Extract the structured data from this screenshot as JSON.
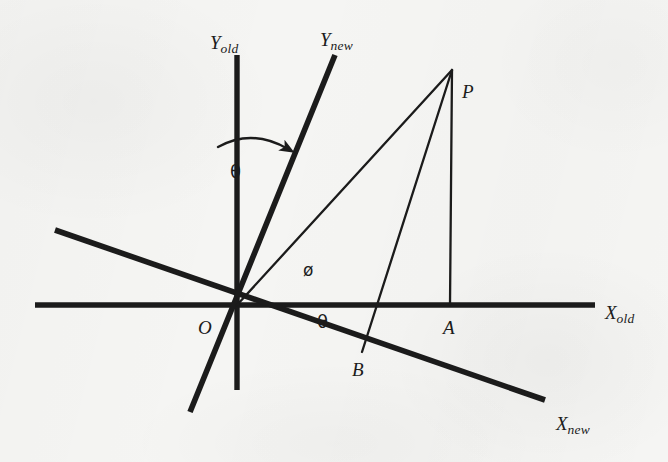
{
  "figure": {
    "kind": "coordinate-rotation-diagram",
    "background_color": "#f5f5f3",
    "ink_color": "#1b1b1b"
  },
  "axes": [
    {
      "id": "x-old",
      "base": "X",
      "sub": "old",
      "label": "X_old",
      "style": "thick",
      "from": [
        35,
        305
      ],
      "to": [
        595,
        305
      ],
      "label_pos": [
        605,
        303
      ]
    },
    {
      "id": "y-old",
      "base": "Y",
      "sub": "old",
      "label": "Y_old",
      "style": "thick",
      "from": [
        237,
        55
      ],
      "to": [
        237,
        390
      ],
      "label_pos": [
        210,
        33
      ]
    },
    {
      "id": "x-new",
      "base": "X",
      "sub": "new",
      "label": "X_new",
      "style": "thick",
      "from": [
        55,
        230
      ],
      "to": [
        545,
        400
      ],
      "label_pos": [
        556,
        414
      ]
    },
    {
      "id": "y-new",
      "base": "Y",
      "sub": "new",
      "label": "Y_new",
      "style": "thick",
      "from": [
        335,
        55
      ],
      "to": [
        190,
        412
      ],
      "label_pos": [
        320,
        30
      ]
    }
  ],
  "points": [
    {
      "id": "O",
      "label": "O",
      "pos": [
        237,
        305
      ],
      "label_pos": [
        198,
        318
      ]
    },
    {
      "id": "P",
      "label": "P",
      "pos": [
        452,
        70
      ],
      "label_pos": [
        462,
        82
      ]
    },
    {
      "id": "A",
      "label": "A",
      "pos": [
        450,
        305
      ],
      "label_pos": [
        443,
        318
      ]
    },
    {
      "id": "B",
      "label": "B",
      "pos": [
        362,
        352
      ],
      "label_pos": [
        352,
        360
      ]
    }
  ],
  "segments": [
    {
      "id": "OP",
      "from": "O",
      "to": "P",
      "style": "thin"
    },
    {
      "id": "PA",
      "from": "P",
      "to": "A",
      "style": "thin"
    },
    {
      "id": "PB",
      "from": "P",
      "to": "B",
      "style": "thin"
    }
  ],
  "angles": [
    {
      "id": "theta-rotation",
      "symbol": "θ",
      "label_pos": [
        230,
        163
      ],
      "description": "rotation angle between Y_old and Y_new",
      "arc": {
        "cx": 237,
        "cy": 305,
        "r": 160,
        "start_deg": 97,
        "end_deg": 68,
        "arrow": true
      }
    },
    {
      "id": "theta-axis",
      "symbol": "θ",
      "label_pos": [
        317,
        313
      ],
      "description": "angle between X_old and X_new at origin"
    },
    {
      "id": "phi",
      "symbol": "ø",
      "label_pos": [
        303,
        262
      ],
      "description": "angle between X_new and OP"
    }
  ]
}
